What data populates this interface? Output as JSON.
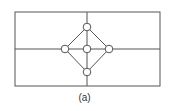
{
  "diagram": {
    "caption": "(a)",
    "colors": {
      "stroke": "#555555",
      "node_fill": "#ffffff",
      "background": "#ffffff"
    },
    "frame": {
      "x": 15,
      "y": 12,
      "width": 145,
      "height": 74
    },
    "grid_lines": [
      {
        "id": "horizontal-midline",
        "x1": 15,
        "y1": 49,
        "x2": 160,
        "y2": 49
      },
      {
        "id": "vertical-midline",
        "x1": 87,
        "y1": 12,
        "x2": 87,
        "y2": 86
      }
    ],
    "nodes": [
      {
        "id": "top",
        "cx": 87,
        "cy": 27,
        "r": 3.8
      },
      {
        "id": "left",
        "cx": 65,
        "cy": 49,
        "r": 3.8
      },
      {
        "id": "center",
        "cx": 87,
        "cy": 49,
        "r": 3.8
      },
      {
        "id": "right",
        "cx": 109,
        "cy": 49,
        "r": 3.8
      },
      {
        "id": "bottom",
        "cx": 87,
        "cy": 72,
        "r": 3.8
      }
    ],
    "edges": [
      [
        "top",
        "left"
      ],
      [
        "top",
        "right"
      ],
      [
        "bottom",
        "left"
      ],
      [
        "bottom",
        "right"
      ],
      [
        "top",
        "center"
      ],
      [
        "center",
        "bottom"
      ],
      [
        "left",
        "center"
      ],
      [
        "center",
        "right"
      ]
    ]
  }
}
